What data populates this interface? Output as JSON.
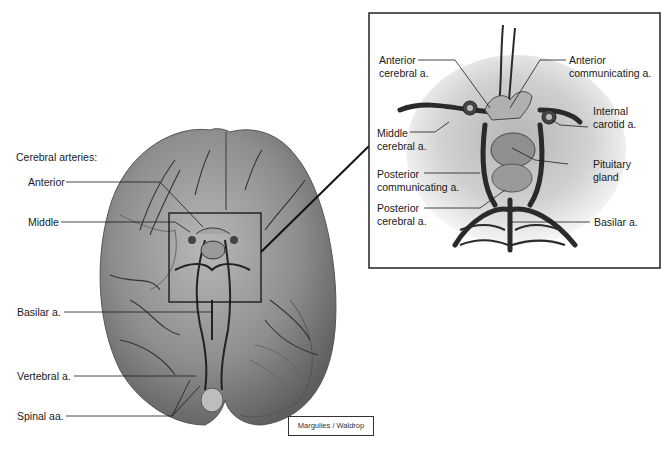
{
  "figure": {
    "main_view": {
      "heading": "Cerebral arteries:",
      "labels": [
        {
          "text": "Anterior"
        },
        {
          "text": "Middle"
        },
        {
          "text": "Basilar a."
        },
        {
          "text": "Vertebral a."
        },
        {
          "text": "Spinal aa."
        }
      ]
    },
    "inset_view": {
      "labels": [
        {
          "text": "Anterior\ncerebral a."
        },
        {
          "text": "Anterior\ncommunicating a."
        },
        {
          "text": "Internal\ncarotid a."
        },
        {
          "text": "Middle\ncerebral a."
        },
        {
          "text": "Pituitary\ngland"
        },
        {
          "text": "Posterior\ncommunicating a."
        },
        {
          "text": "Posterior\ncerebral a."
        },
        {
          "text": "Basilar a."
        }
      ]
    },
    "credit": "Margulies / Waldrop",
    "colors": {
      "brain_fill": "#8a8a8a",
      "brain_light": "#b5b5b5",
      "vessel": "#2a2a2a",
      "leader_line": "#1a1a1a"
    }
  }
}
